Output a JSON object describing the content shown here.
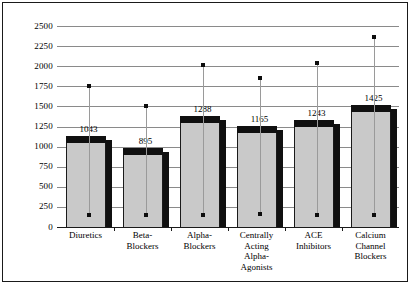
{
  "chart_data": {
    "type": "bar",
    "title": "",
    "subtitle": "",
    "xlabel": "",
    "ylabel": "",
    "ylim": [
      0,
      2500
    ],
    "grid": true,
    "legend": "none",
    "categories": [
      "Diuretics",
      "Beta-Blockers",
      "Alpha-Blockers",
      "Centrally Acting Alpha-Agonists",
      "ACE Inhibitors",
      "Calcium Channel Blockers"
    ],
    "category_label_lines": [
      [
        "Diuretics"
      ],
      [
        "Beta-",
        "Blockers"
      ],
      [
        "Alpha-",
        "Blockers"
      ],
      [
        "Centrally",
        "Acting",
        "Alpha-",
        "Agonists"
      ],
      [
        "ACE",
        "Inhibitors"
      ],
      [
        "Calcium",
        "Channel",
        "Blockers"
      ]
    ],
    "values": [
      1043,
      895,
      1288,
      1165,
      1243,
      1425
    ],
    "value_labels": [
      "1043",
      "895",
      "1288",
      "1165",
      "1243",
      "1425"
    ],
    "error_high": [
      1750,
      1510,
      2020,
      1855,
      2040,
      2360
    ],
    "error_low": [
      155,
      155,
      155,
      160,
      155,
      155
    ],
    "yticks": [
      0,
      250,
      500,
      750,
      1000,
      1250,
      1500,
      1750,
      2000,
      2250,
      2500
    ],
    "ytick_labels": [
      "0",
      "250",
      "500",
      "750",
      "1000",
      "1250",
      "1500",
      "1750",
      "2000",
      "2250",
      "2500"
    ],
    "colors": {
      "bar_front": "#c9c9c9",
      "bar_top": "#101010",
      "bar_side": "#101010",
      "gridline": "#8a8a8a",
      "axis": "#1a1a1a",
      "error_line": "#9a9a9a",
      "error_dot": "#0d0d0d",
      "background": "#ffffff",
      "border": "#1a1a1a"
    }
  }
}
